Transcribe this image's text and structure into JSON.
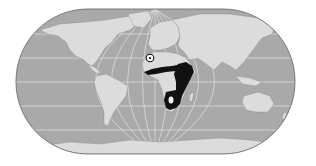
{
  "map": {
    "type": "world-distribution-map",
    "projection": "pseudocylindrical (rounded rectangle)",
    "description": "World map with a species range highlighted in sub-Saharan Africa and a circled point marker in northwest Africa",
    "colors": {
      "background": "#ffffff",
      "ocean": "#a9a9a9",
      "land": "#dcdcdc",
      "graticule": "#e6e6e6",
      "outline": "#6e6e6e",
      "range": "#111111",
      "marker": "#111111"
    },
    "features": {
      "range": {
        "label": "distribution range",
        "region": "Sub-Saharan Africa (Sahel belt, East Africa, southern Africa)"
      },
      "marker": {
        "label": "isolated record",
        "region": "Northwest Africa",
        "position": {
          "x": 150,
          "y": 58
        }
      }
    },
    "gridlines": {
      "latitude_y": [
        34,
        58,
        82,
        106,
        130
      ],
      "meridians": 9
    }
  }
}
